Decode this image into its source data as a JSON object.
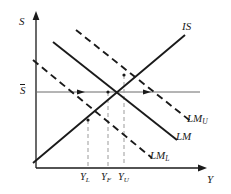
{
  "figure": {
    "type": "is-lm-diagram",
    "background_color": "#ffffff",
    "line_color": "#1a1a1a",
    "dash_color": "#3a3a3a",
    "guide_color": "#9a9a9a"
  },
  "axes": {
    "y_axis_label": "S",
    "x_axis_label": "Y",
    "origin": {
      "x": 36,
      "y": 168
    },
    "y_axis_top": {
      "x": 36,
      "y": 14
    },
    "x_axis_right": {
      "x": 205,
      "y": 168
    }
  },
  "reference_line": {
    "label": "S",
    "label_has_overbar": true,
    "y": 92,
    "x_start": 36,
    "x_end": 200
  },
  "curves": [
    {
      "name": "IS",
      "label": "IS",
      "style": "solid",
      "slope": "upward",
      "x1": 33,
      "y1": 163,
      "x2": 185,
      "y2": 35,
      "label_x": 184,
      "label_y": 25
    },
    {
      "name": "LM",
      "label": "LM",
      "style": "solid",
      "slope": "downward",
      "x1": 53,
      "y1": 42,
      "x2": 177,
      "y2": 140,
      "label_x": 177,
      "label_y": 135
    },
    {
      "name": "LM_U",
      "label": "LM",
      "sublabel": "U",
      "style": "dashed",
      "slope": "downward",
      "x1": 76,
      "y1": 30,
      "x2": 193,
      "y2": 123,
      "label_x": 190,
      "label_y": 119
    },
    {
      "name": "LM_L",
      "label": "LM",
      "sublabel": "L",
      "style": "dashed",
      "slope": "downward",
      "x1": 33,
      "y1": 60,
      "x2": 152,
      "y2": 158,
      "label_x": 152,
      "label_y": 153
    }
  ],
  "equilibria": [
    {
      "name": "lower-equilibrium",
      "x": 88,
      "y": 120,
      "curves": "IS x LM_L"
    },
    {
      "name": "full-equilibrium",
      "x": 108,
      "y": 92,
      "curves": "IS x LM"
    },
    {
      "name": "upper-equilibrium",
      "x": 124,
      "y": 75,
      "curves": "IS x LM_U"
    }
  ],
  "x_ticks": [
    {
      "name": "Y_L",
      "label": "Y",
      "sublabel": "L",
      "x": 88,
      "label_x": 81,
      "label_y": 172
    },
    {
      "name": "Y_F",
      "label": "Y",
      "sublabel": "F",
      "x": 108,
      "label_x": 101,
      "label_y": 172
    },
    {
      "name": "Y_U",
      "label": "Y",
      "sublabel": "U",
      "x": 124,
      "label_x": 118,
      "label_y": 172
    }
  ],
  "arrow_markers": [
    {
      "name": "marker-on-lm-l",
      "x": 81,
      "y": 92
    },
    {
      "name": "marker-on-lm-u",
      "x": 147,
      "y": 92
    }
  ]
}
